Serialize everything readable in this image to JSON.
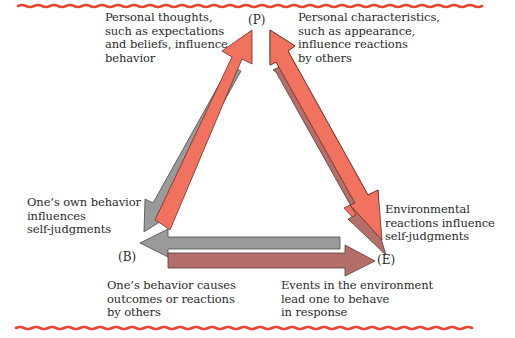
{
  "diagram": {
    "type": "reciprocal-determinism-triangle",
    "colors": {
      "border_wave": "#e8432e",
      "salmon": "#f0725f",
      "gray": "#9a9a9a",
      "mauve": "#b46f6a",
      "outline": "#5a3a36"
    },
    "nodes": {
      "P": "(P)",
      "B": "(B)",
      "E": "(E)"
    },
    "labels": {
      "p_to_b_thoughts": "Personal thoughts,\nsuch as expectations\nand beliefs, influence\nbehavior",
      "p_to_e_characteristics": "Personal characteristics,\nsuch as appearance,\ninfluence reactions\nby others",
      "b_to_p_self_judgments": "One’s own behavior\ninfluences\nself-judgments",
      "e_to_p_self_judgments": "Environmental\nreactions influence\nself-judgments",
      "b_to_e_outcomes": "One’s behavior causes\noutcomes or reactions\nby others",
      "e_to_b_events": "Events in the environment\nlead one to behave\nin response"
    },
    "arrows": [
      {
        "from": "P",
        "to": "B",
        "color": "gray"
      },
      {
        "from": "B",
        "to": "P",
        "color": "salmon"
      },
      {
        "from": "P",
        "to": "E",
        "color": "salmon"
      },
      {
        "from": "E",
        "to": "P",
        "color": "mauve"
      },
      {
        "from": "E",
        "to": "B",
        "color": "gray"
      },
      {
        "from": "B",
        "to": "E",
        "color": "mauve"
      }
    ]
  }
}
